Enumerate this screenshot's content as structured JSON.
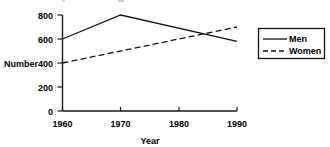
{
  "chart_data": {
    "type": "line",
    "title": "",
    "xlabel": "Year",
    "ylabel": "Number",
    "x": [
      1960,
      1970,
      1980,
      1990
    ],
    "xlim": [
      1960,
      1990
    ],
    "ylim": [
      0,
      800
    ],
    "xticks": [
      "1960",
      "1970",
      "1980",
      "1990"
    ],
    "yticks": [
      "0",
      "200",
      "400",
      "600",
      "800"
    ],
    "grid": false,
    "legend_position": "right",
    "series": [
      {
        "name": "Men",
        "style": "solid",
        "x": [
          1960,
          1970,
          1990
        ],
        "values": [
          600,
          800,
          580
        ]
      },
      {
        "name": "Women",
        "style": "dashed",
        "x": [
          1960,
          1990
        ],
        "values": [
          400,
          700
        ]
      }
    ]
  },
  "axes": {
    "y": {
      "title": "Number",
      "ticks": [
        {
          "label": "800",
          "value": 800
        },
        {
          "label": "600",
          "value": 600
        },
        {
          "label": "400",
          "value": 400
        },
        {
          "label": "200",
          "value": 200
        },
        {
          "label": "0",
          "value": 0
        }
      ]
    },
    "x": {
      "title": "Year",
      "ticks": [
        {
          "label": "1960",
          "value": 1960
        },
        {
          "label": "1970",
          "value": 1970
        },
        {
          "label": "1980",
          "value": 1980
        },
        {
          "label": "1990",
          "value": 1990
        }
      ]
    }
  },
  "legend": {
    "entries": [
      {
        "label": "Men",
        "style": "solid"
      },
      {
        "label": "Women",
        "style": "dashed"
      }
    ]
  },
  "colors": {
    "line": "#111111",
    "axis": "#1a1a1a",
    "text": "#000000",
    "background": "#ffffff"
  }
}
